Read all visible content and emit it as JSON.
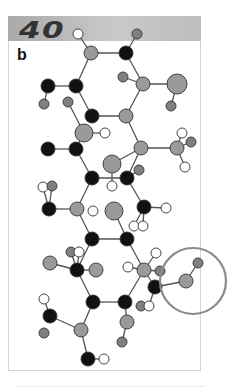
{
  "header": {
    "number": "40",
    "color": "#b4b4b4"
  },
  "panel": {
    "label": "b"
  },
  "colors": {
    "black": "#111111",
    "gray": "#9a9a9a",
    "dgray": "#808080",
    "white": "#ffffff",
    "stroke": "#333333",
    "bond": "#555555",
    "highlight": "#8a8a8a"
  },
  "highlight_circle": {
    "cx": 193,
    "cy": 281,
    "r": 33
  },
  "atoms": [
    {
      "id": "a1",
      "x": 78,
      "y": 34,
      "r": 5,
      "c": "white"
    },
    {
      "id": "a2",
      "x": 137,
      "y": 34,
      "r": 5,
      "c": "dgray"
    },
    {
      "id": "a3",
      "x": 91,
      "y": 53,
      "r": 7,
      "c": "gray"
    },
    {
      "id": "a4",
      "x": 126,
      "y": 53,
      "r": 7,
      "c": "black"
    },
    {
      "id": "a5",
      "x": 123,
      "y": 77,
      "r": 5,
      "c": "dgray"
    },
    {
      "id": "a6",
      "x": 143,
      "y": 84,
      "r": 7,
      "c": "gray"
    },
    {
      "id": "a7",
      "x": 177,
      "y": 84,
      "r": 10,
      "c": "gray"
    },
    {
      "id": "a8",
      "x": 171,
      "y": 106,
      "r": 5,
      "c": "dgray"
    },
    {
      "id": "a9",
      "x": 48,
      "y": 86,
      "r": 7,
      "c": "black"
    },
    {
      "id": "a10",
      "x": 76,
      "y": 86,
      "r": 7,
      "c": "black"
    },
    {
      "id": "a11",
      "x": 44,
      "y": 104,
      "r": 5,
      "c": "dgray"
    },
    {
      "id": "a12",
      "x": 68,
      "y": 102,
      "r": 5,
      "c": "dgray"
    },
    {
      "id": "a13",
      "x": 92,
      "y": 116,
      "r": 7,
      "c": "black"
    },
    {
      "id": "a14",
      "x": 126,
      "y": 116,
      "r": 7,
      "c": "gray"
    },
    {
      "id": "a15",
      "x": 84,
      "y": 133,
      "r": 9,
      "c": "gray"
    },
    {
      "id": "a16",
      "x": 105,
      "y": 133,
      "r": 5,
      "c": "white"
    },
    {
      "id": "a17",
      "x": 48,
      "y": 149,
      "r": 7,
      "c": "black"
    },
    {
      "id": "a18",
      "x": 76,
      "y": 149,
      "r": 7,
      "c": "black"
    },
    {
      "id": "a19",
      "x": 141,
      "y": 148,
      "r": 7,
      "c": "gray"
    },
    {
      "id": "a20",
      "x": 177,
      "y": 148,
      "r": 7,
      "c": "gray"
    },
    {
      "id": "a21",
      "x": 182,
      "y": 133,
      "r": 5,
      "c": "white"
    },
    {
      "id": "a22",
      "x": 191,
      "y": 142,
      "r": 5,
      "c": "dgray"
    },
    {
      "id": "a23",
      "x": 185,
      "y": 167,
      "r": 5,
      "c": "white"
    },
    {
      "id": "a24",
      "x": 112,
      "y": 164,
      "r": 9,
      "c": "gray"
    },
    {
      "id": "a25",
      "x": 92,
      "y": 178,
      "r": 7,
      "c": "black"
    },
    {
      "id": "a26",
      "x": 127,
      "y": 178,
      "r": 7,
      "c": "black"
    },
    {
      "id": "a27",
      "x": 139,
      "y": 170,
      "r": 5,
      "c": "dgray"
    },
    {
      "id": "a28",
      "x": 112,
      "y": 186,
      "r": 5,
      "c": "white"
    },
    {
      "id": "a29",
      "x": 43,
      "y": 187,
      "r": 5,
      "c": "white"
    },
    {
      "id": "a30",
      "x": 52,
      "y": 186,
      "r": 5,
      "c": "dgray"
    },
    {
      "id": "a31",
      "x": 49,
      "y": 209,
      "r": 7,
      "c": "black"
    },
    {
      "id": "a32",
      "x": 77,
      "y": 209,
      "r": 7,
      "c": "gray"
    },
    {
      "id": "a33",
      "x": 93,
      "y": 211,
      "r": 5,
      "c": "white"
    },
    {
      "id": "a34",
      "x": 114,
      "y": 211,
      "r": 9,
      "c": "gray"
    },
    {
      "id": "a35",
      "x": 144,
      "y": 207,
      "r": 7,
      "c": "black"
    },
    {
      "id": "a36",
      "x": 166,
      "y": 208,
      "r": 5,
      "c": "white"
    },
    {
      "id": "a37",
      "x": 134,
      "y": 226,
      "r": 5,
      "c": "white"
    },
    {
      "id": "a38",
      "x": 143,
      "y": 226,
      "r": 5,
      "c": "white"
    },
    {
      "id": "a39",
      "x": 92,
      "y": 239,
      "r": 7,
      "c": "black"
    },
    {
      "id": "a40",
      "x": 127,
      "y": 239,
      "r": 7,
      "c": "black"
    },
    {
      "id": "a41",
      "x": 71,
      "y": 252,
      "r": 5,
      "c": "dgray"
    },
    {
      "id": "a42",
      "x": 79,
      "y": 252,
      "r": 5,
      "c": "white"
    },
    {
      "id": "a43",
      "x": 50,
      "y": 263,
      "r": 7,
      "c": "gray"
    },
    {
      "id": "a44",
      "x": 77,
      "y": 270,
      "r": 7,
      "c": "black"
    },
    {
      "id": "a45",
      "x": 96,
      "y": 270,
      "r": 7,
      "c": "gray"
    },
    {
      "id": "a46",
      "x": 128,
      "y": 267,
      "r": 5,
      "c": "white"
    },
    {
      "id": "a47",
      "x": 144,
      "y": 270,
      "r": 7,
      "c": "gray"
    },
    {
      "id": "a48",
      "x": 156,
      "y": 253,
      "r": 5,
      "c": "white"
    },
    {
      "id": "a49",
      "x": 160,
      "y": 271,
      "r": 5,
      "c": "dgray"
    },
    {
      "id": "a50",
      "x": 186,
      "y": 281,
      "r": 7,
      "c": "gray"
    },
    {
      "id": "a51",
      "x": 198,
      "y": 263,
      "r": 5,
      "c": "dgray"
    },
    {
      "id": "a52",
      "x": 155,
      "y": 287,
      "r": 7,
      "c": "black"
    },
    {
      "id": "a53",
      "x": 93,
      "y": 302,
      "r": 7,
      "c": "black"
    },
    {
      "id": "a54",
      "x": 125,
      "y": 302,
      "r": 7,
      "c": "black"
    },
    {
      "id": "a55",
      "x": 141,
      "y": 306,
      "r": 5,
      "c": "dgray"
    },
    {
      "id": "a56",
      "x": 149,
      "y": 306,
      "r": 5,
      "c": "white"
    },
    {
      "id": "a57",
      "x": 44,
      "y": 299,
      "r": 5,
      "c": "white"
    },
    {
      "id": "a58",
      "x": 50,
      "y": 316,
      "r": 7,
      "c": "black"
    },
    {
      "id": "a59",
      "x": 127,
      "y": 322,
      "r": 7,
      "c": "gray"
    },
    {
      "id": "a60",
      "x": 81,
      "y": 330,
      "r": 7,
      "c": "gray"
    },
    {
      "id": "a61",
      "x": 44,
      "y": 333,
      "r": 5,
      "c": "dgray"
    },
    {
      "id": "a62",
      "x": 122,
      "y": 342,
      "r": 5,
      "c": "dgray"
    },
    {
      "id": "a63",
      "x": 88,
      "y": 359,
      "r": 7,
      "c": "black"
    },
    {
      "id": "a64",
      "x": 104,
      "y": 359,
      "r": 5,
      "c": "white"
    }
  ],
  "bonds": [
    [
      "a1",
      "a3"
    ],
    [
      "a2",
      "a4"
    ],
    [
      "a3",
      "a4"
    ],
    [
      "a4",
      "a6"
    ],
    [
      "a5",
      "a6"
    ],
    [
      "a6",
      "a7"
    ],
    [
      "a7",
      "a8"
    ],
    [
      "a3",
      "a10"
    ],
    [
      "a9",
      "a10"
    ],
    [
      "a9",
      "a11"
    ],
    [
      "a10",
      "a13"
    ],
    [
      "a6",
      "a14"
    ],
    [
      "a13",
      "a14"
    ],
    [
      "a12",
      "a15"
    ],
    [
      "a15",
      "a16"
    ],
    [
      "a15",
      "a18"
    ],
    [
      "a17",
      "a18"
    ],
    [
      "a14",
      "a19"
    ],
    [
      "a19",
      "a20"
    ],
    [
      "a20",
      "a21"
    ],
    [
      "a20",
      "a22"
    ],
    [
      "a20",
      "a23"
    ],
    [
      "a19",
      "a24"
    ],
    [
      "a19",
      "a26"
    ],
    [
      "a18",
      "a25"
    ],
    [
      "a25",
      "a26"
    ],
    [
      "a26",
      "a27"
    ],
    [
      "a24",
      "a28"
    ],
    [
      "a29",
      "a31"
    ],
    [
      "a30",
      "a31"
    ],
    [
      "a31",
      "a32"
    ],
    [
      "a25",
      "a32"
    ],
    [
      "a26",
      "a35"
    ],
    [
      "a35",
      "a36"
    ],
    [
      "a35",
      "a37"
    ],
    [
      "a35",
      "a38"
    ],
    [
      "a34",
      "a40"
    ],
    [
      "a32",
      "a39"
    ],
    [
      "a39",
      "a40"
    ],
    [
      "a39",
      "a44"
    ],
    [
      "a41",
      "a44"
    ],
    [
      "a42",
      "a44"
    ],
    [
      "a43",
      "a44"
    ],
    [
      "a44",
      "a45"
    ],
    [
      "a40",
      "a47"
    ],
    [
      "a46",
      "a47"
    ],
    [
      "a47",
      "a48"
    ],
    [
      "a47",
      "a49"
    ],
    [
      "a47",
      "a52"
    ],
    [
      "a52",
      "a50"
    ],
    [
      "a50",
      "a51"
    ],
    [
      "a52",
      "a56"
    ],
    [
      "a44",
      "a53"
    ],
    [
      "a53",
      "a54"
    ],
    [
      "a54",
      "a47"
    ],
    [
      "a57",
      "a58"
    ],
    [
      "a58",
      "a60"
    ],
    [
      "a53",
      "a60"
    ],
    [
      "a60",
      "a63"
    ],
    [
      "a63",
      "a64"
    ],
    [
      "a54",
      "a59"
    ],
    [
      "a59",
      "a62"
    ],
    [
      "a55",
      "a56"
    ]
  ]
}
